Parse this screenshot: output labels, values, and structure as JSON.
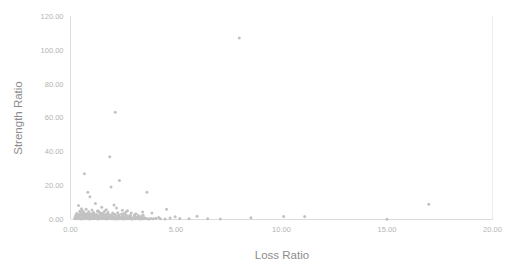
{
  "chart_data": {
    "type": "scatter",
    "title": "",
    "xlabel": "Loss Ratio",
    "ylabel": "Strength Ratio",
    "xlim": [
      0,
      20
    ],
    "ylim": [
      0,
      120
    ],
    "xticks": [
      "0.00",
      "5.00",
      "10.00",
      "15.00",
      "20.00"
    ],
    "yticks": [
      "0.00",
      "20.00",
      "40.00",
      "60.00",
      "80.00",
      "100.00",
      "120.00"
    ],
    "xtick_values": [
      0,
      5,
      10,
      15,
      20
    ],
    "ytick_values": [
      0,
      20,
      40,
      60,
      80,
      100,
      120
    ],
    "grid": false,
    "legend": "none",
    "marker_color": "#c2c2c2",
    "marker_size": 2,
    "points": [
      [
        8.0,
        107.0
      ],
      [
        2.12,
        63.2
      ],
      [
        1.86,
        37.0
      ],
      [
        0.66,
        27.0
      ],
      [
        2.32,
        23.0
      ],
      [
        1.92,
        19.2
      ],
      [
        0.82,
        16.0
      ],
      [
        3.62,
        16.0
      ],
      [
        0.92,
        13.4
      ],
      [
        16.98,
        9.0
      ],
      [
        0.38,
        8.2
      ],
      [
        1.18,
        9.4
      ],
      [
        2.06,
        8.6
      ],
      [
        1.48,
        7.2
      ],
      [
        4.55,
        6.0
      ],
      [
        0.52,
        6.4
      ],
      [
        0.74,
        6.0
      ],
      [
        1.02,
        5.6
      ],
      [
        1.3,
        5.2
      ],
      [
        1.62,
        5.0
      ],
      [
        2.46,
        5.4
      ],
      [
        2.7,
        5.2
      ],
      [
        3.42,
        4.4
      ],
      [
        0.44,
        4.8
      ],
      [
        0.62,
        4.4
      ],
      [
        0.86,
        4.6
      ],
      [
        1.1,
        4.2
      ],
      [
        1.36,
        4.4
      ],
      [
        1.56,
        4.0
      ],
      [
        1.78,
        4.2
      ],
      [
        2.0,
        3.8
      ],
      [
        2.24,
        4.0
      ],
      [
        2.54,
        3.6
      ],
      [
        2.88,
        3.8
      ],
      [
        3.1,
        3.4
      ],
      [
        0.3,
        3.6
      ],
      [
        0.48,
        3.8
      ],
      [
        0.68,
        3.4
      ],
      [
        0.8,
        3.6
      ],
      [
        0.96,
        3.2
      ],
      [
        1.12,
        3.4
      ],
      [
        1.24,
        3.0
      ],
      [
        1.4,
        3.2
      ],
      [
        1.52,
        2.8
      ],
      [
        1.68,
        3.0
      ],
      [
        1.84,
        2.6
      ],
      [
        1.98,
        2.8
      ],
      [
        2.14,
        2.4
      ],
      [
        2.3,
        2.6
      ],
      [
        2.48,
        2.2
      ],
      [
        2.66,
        2.4
      ],
      [
        2.84,
        2.0
      ],
      [
        3.02,
        2.2
      ],
      [
        3.2,
        1.8
      ],
      [
        3.38,
        2.0
      ],
      [
        0.26,
        2.6
      ],
      [
        0.36,
        2.2
      ],
      [
        0.46,
        2.8
      ],
      [
        0.56,
        2.4
      ],
      [
        0.66,
        2.0
      ],
      [
        0.76,
        2.6
      ],
      [
        0.86,
        2.2
      ],
      [
        0.96,
        1.8
      ],
      [
        1.06,
        2.4
      ],
      [
        1.16,
        2.0
      ],
      [
        1.26,
        1.6
      ],
      [
        1.36,
        2.2
      ],
      [
        1.46,
        1.8
      ],
      [
        1.56,
        1.4
      ],
      [
        1.66,
        2.0
      ],
      [
        1.76,
        1.6
      ],
      [
        1.86,
        1.2
      ],
      [
        1.96,
        1.8
      ],
      [
        2.06,
        1.4
      ],
      [
        2.16,
        1.0
      ],
      [
        2.26,
        1.6
      ],
      [
        2.36,
        1.2
      ],
      [
        2.46,
        1.8
      ],
      [
        2.56,
        1.4
      ],
      [
        2.66,
        1.0
      ],
      [
        2.76,
        1.6
      ],
      [
        2.86,
        1.2
      ],
      [
        2.96,
        0.8
      ],
      [
        3.06,
        1.4
      ],
      [
        3.16,
        1.0
      ],
      [
        3.26,
        0.6
      ],
      [
        3.36,
        1.2
      ],
      [
        0.22,
        1.4
      ],
      [
        0.3,
        1.0
      ],
      [
        0.38,
        1.6
      ],
      [
        0.46,
        1.2
      ],
      [
        0.54,
        0.8
      ],
      [
        0.62,
        1.4
      ],
      [
        0.7,
        1.0
      ],
      [
        0.78,
        1.6
      ],
      [
        0.86,
        1.2
      ],
      [
        0.94,
        0.8
      ],
      [
        1.02,
        1.4
      ],
      [
        1.1,
        1.0
      ],
      [
        1.18,
        0.6
      ],
      [
        1.26,
        1.2
      ],
      [
        1.34,
        0.8
      ],
      [
        1.42,
        1.4
      ],
      [
        1.5,
        1.0
      ],
      [
        1.58,
        0.6
      ],
      [
        1.66,
        1.2
      ],
      [
        1.74,
        0.8
      ],
      [
        1.82,
        1.4
      ],
      [
        1.9,
        1.0
      ],
      [
        1.98,
        0.6
      ],
      [
        2.06,
        1.2
      ],
      [
        2.14,
        0.8
      ],
      [
        2.22,
        0.4
      ],
      [
        2.3,
        1.0
      ],
      [
        2.38,
        0.6
      ],
      [
        2.46,
        1.2
      ],
      [
        2.54,
        0.8
      ],
      [
        2.62,
        0.4
      ],
      [
        2.7,
        1.0
      ],
      [
        2.78,
        0.6
      ],
      [
        2.86,
        1.2
      ],
      [
        2.94,
        0.8
      ],
      [
        3.02,
        0.4
      ],
      [
        3.1,
        1.0
      ],
      [
        3.18,
        0.6
      ],
      [
        3.26,
        1.2
      ],
      [
        3.34,
        0.8
      ],
      [
        3.42,
        0.4
      ],
      [
        3.5,
        1.0
      ],
      [
        0.2,
        0.6
      ],
      [
        0.28,
        0.4
      ],
      [
        0.36,
        0.8
      ],
      [
        0.44,
        0.5
      ],
      [
        0.52,
        0.3
      ],
      [
        0.6,
        0.7
      ],
      [
        0.68,
        0.4
      ],
      [
        0.76,
        0.9
      ],
      [
        0.84,
        0.5
      ],
      [
        0.92,
        0.3
      ],
      [
        1.0,
        0.7
      ],
      [
        1.08,
        0.4
      ],
      [
        1.16,
        0.8
      ],
      [
        1.24,
        0.5
      ],
      [
        1.32,
        0.3
      ],
      [
        1.4,
        0.7
      ],
      [
        1.48,
        0.4
      ],
      [
        1.56,
        0.9
      ],
      [
        1.64,
        0.5
      ],
      [
        1.72,
        0.3
      ],
      [
        1.8,
        0.7
      ],
      [
        1.88,
        0.4
      ],
      [
        1.96,
        0.8
      ],
      [
        2.04,
        0.5
      ],
      [
        2.12,
        0.3
      ],
      [
        2.2,
        0.7
      ],
      [
        2.28,
        0.4
      ],
      [
        2.36,
        0.9
      ],
      [
        2.44,
        0.5
      ],
      [
        2.52,
        0.3
      ],
      [
        2.6,
        0.7
      ],
      [
        2.68,
        0.4
      ],
      [
        2.76,
        0.8
      ],
      [
        2.84,
        0.5
      ],
      [
        2.92,
        0.3
      ],
      [
        3.0,
        0.7
      ],
      [
        3.08,
        0.4
      ],
      [
        3.16,
        0.9
      ],
      [
        3.24,
        0.5
      ],
      [
        3.32,
        0.3
      ],
      [
        3.4,
        0.7
      ],
      [
        3.48,
        0.4
      ],
      [
        3.56,
        0.8
      ],
      [
        3.64,
        0.5
      ],
      [
        3.72,
        0.3
      ],
      [
        3.8,
        0.6
      ],
      [
        3.92,
        0.4
      ],
      [
        4.04,
        0.8
      ],
      [
        4.26,
        0.5
      ],
      [
        4.48,
        0.3
      ],
      [
        4.72,
        0.9
      ],
      [
        4.96,
        1.6
      ],
      [
        5.18,
        0.6
      ],
      [
        5.62,
        0.4
      ],
      [
        6.0,
        1.9
      ],
      [
        6.5,
        0.5
      ],
      [
        7.1,
        0.3
      ],
      [
        8.55,
        1.1
      ],
      [
        10.1,
        1.8
      ],
      [
        11.1,
        1.7
      ],
      [
        15.0,
        0.2
      ],
      [
        0.24,
        1.9
      ],
      [
        0.34,
        2.9
      ],
      [
        0.42,
        1.5
      ],
      [
        0.58,
        3.1
      ],
      [
        0.72,
        2.3
      ],
      [
        0.9,
        2.9
      ],
      [
        1.04,
        3.5
      ],
      [
        1.2,
        2.5
      ],
      [
        1.44,
        3.7
      ],
      [
        1.6,
        2.3
      ],
      [
        1.74,
        3.3
      ],
      [
        1.94,
        2.7
      ],
      [
        2.1,
        3.1
      ],
      [
        2.28,
        2.5
      ],
      [
        2.42,
        3.3
      ],
      [
        2.6,
        2.9
      ],
      [
        2.82,
        2.5
      ],
      [
        3.04,
        2.7
      ],
      [
        3.22,
        2.3
      ],
      [
        3.44,
        2.5
      ],
      [
        1.28,
        4.8
      ],
      [
        2.18,
        6.8
      ],
      [
        0.56,
        5.2
      ],
      [
        1.7,
        5.8
      ],
      [
        2.64,
        4.6
      ],
      [
        3.86,
        3.8
      ],
      [
        4.18,
        1.2
      ]
    ]
  }
}
